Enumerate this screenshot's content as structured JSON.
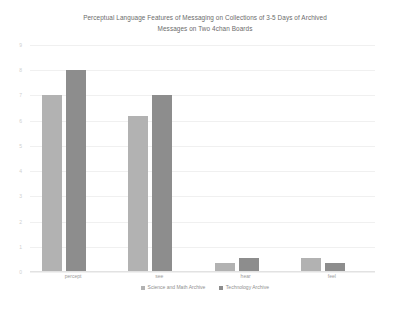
{
  "chart_data": {
    "type": "bar",
    "title": "Perceptual Language Features of Messaging on Collections of 3-5 Days of Archived\nMessages on Two 4chan Boards",
    "xlabel": "",
    "ylabel": "",
    "categories": [
      "percept",
      "see",
      "hear",
      "feel"
    ],
    "series": [
      {
        "name": "Science and Math Archive",
        "color": "#b2b2b2",
        "values": [
          7.0,
          6.2,
          0.35,
          0.55
        ]
      },
      {
        "name": "Technology Archive",
        "color": "#8d8d8d",
        "values": [
          8.0,
          7.0,
          0.55,
          0.35
        ]
      }
    ],
    "ylim": [
      0,
      9
    ],
    "yticks": [
      "0",
      "1",
      "2",
      "3",
      "4",
      "5",
      "6",
      "7",
      "8",
      "9"
    ],
    "grid": true,
    "legend_position": "bottom"
  },
  "colors": {
    "series_0": "#b2b2b2",
    "series_1": "#8d8d8d",
    "gridline": "#f0f0f0",
    "title_text": "#6b6b6b",
    "background": "#ffffff"
  }
}
